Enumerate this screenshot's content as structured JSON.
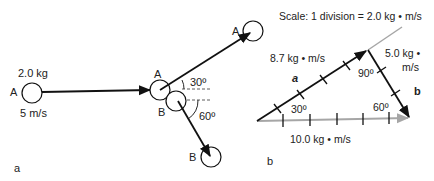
{
  "panel_a": {
    "caption": "a",
    "ball_a_initial": {
      "label": "A",
      "mass": "2.0 kg",
      "speed": "5 m/s"
    },
    "collision": {
      "ball_a_label": "A",
      "ball_b_label": "B",
      "angle_a": "30º",
      "angle_b": "60º"
    },
    "ball_a_final": {
      "label": "A"
    },
    "ball_b_final": {
      "label": "B"
    }
  },
  "panel_b": {
    "caption": "b",
    "scale": "Scale: 1 division = 2.0 kg • m/s",
    "vector_a": {
      "label": "a",
      "magnitude": "8.7 kg • m/s"
    },
    "vector_b": {
      "label": "b",
      "magnitude_line1": "5.0 kg •",
      "magnitude_line2": "m/s"
    },
    "resultant": {
      "magnitude": "10.0 kg • m/s"
    },
    "angles": {
      "left": "30º",
      "top": "90º",
      "right": "60º"
    }
  },
  "colors": {
    "line": "#111111",
    "resultant": "#a6a6a6"
  }
}
